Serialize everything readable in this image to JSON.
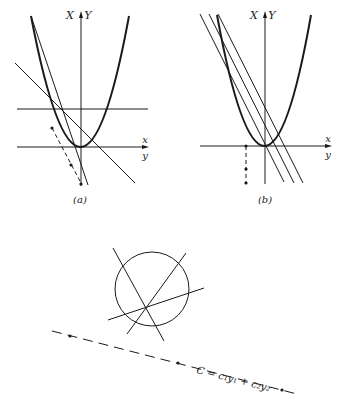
{
  "figure": {
    "panel_a": {
      "caption": "(a)",
      "axis_upper_left": "X",
      "axis_upper_right": "Y",
      "axis_right_upper": "x",
      "axis_right_lower": "y"
    },
    "panel_b": {
      "caption": "(b)",
      "axis_upper_left": "X",
      "axis_upper_right": "Y",
      "axis_right_upper": "x",
      "axis_right_lower": "y"
    },
    "panel_c": {
      "line_label": "C = c₁y₁ + c₂y₂"
    },
    "colors": {
      "ink": "#1a1a1a",
      "background": "#ffffff"
    }
  }
}
